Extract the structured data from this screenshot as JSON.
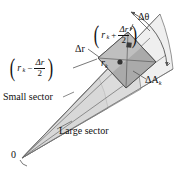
{
  "figure": {
    "name": "polar-area-element",
    "caption_labels": {
      "origin": "0",
      "small_sector": "Small sector",
      "large_sector": "Large sector",
      "delta_theta": "Δθ",
      "delta_r": "Δr",
      "delta_area": "ΔA",
      "delta_area_sub": "k",
      "center_radius": "r",
      "center_radius_sub": "k",
      "outer_radius_expr": "(r_k + Δr/2)",
      "inner_radius_expr": "(r_k - Δr/2)"
    },
    "expressions": {
      "outer": {
        "open_paren": "(",
        "base": "r",
        "sub": "k",
        "operator": "+",
        "numerator": "Δr",
        "denominator": "2",
        "close_paren": ")"
      },
      "inner": {
        "open_paren": "(",
        "base": "r",
        "sub": "k",
        "operator": "−",
        "numerator": "Δr",
        "denominator": "2",
        "close_paren": ")"
      }
    },
    "colors": {
      "background": "#ffffff",
      "stroke": "#555555",
      "text": "#111111",
      "large_sector_fill": "#eeeeee",
      "small_sector_fill": "#dcdcdc",
      "wedge_band_fill": "#d2d2d2",
      "area_patch_fill": "#b3b3b3",
      "area_patch_fill_dark": "#a6a6a6",
      "marker_fill": "#3a3a3a"
    },
    "geometry_notes": {
      "apex": "0",
      "fan_direction": "lower-left to upper-right",
      "patch_subdivisions": 4
    }
  }
}
